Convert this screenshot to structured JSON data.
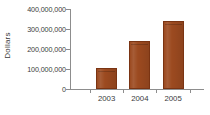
{
  "chart_data": {
    "type": "bar",
    "title": "",
    "xlabel": "",
    "ylabel": "Dollars",
    "categories": [
      "2003",
      "2004",
      "2005"
    ],
    "values": [
      105000000,
      240000000,
      340000000
    ],
    "series": [
      {
        "name": "Dollars",
        "values": [
          105000000,
          240000000,
          340000000
        ]
      }
    ],
    "ylim": [
      0,
      400000000
    ],
    "y_ticks": [
      0,
      100000000,
      200000000,
      300000000,
      400000000
    ],
    "y_tick_labels": [
      "0",
      "100,000,000",
      "200,000,000",
      "300,000,000",
      "400,000,000"
    ],
    "grid": false,
    "legend": false,
    "legend_position": "none",
    "bar_color": "#9C4A20",
    "bar_border_color": "#7A3413",
    "axis_color": "#8D8D8D",
    "text_color": "#3B3B3B",
    "background_color": "#FFFFFF"
  }
}
